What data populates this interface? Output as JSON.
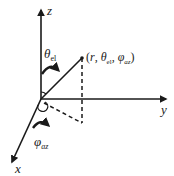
{
  "diagram": {
    "type": "spherical-coordinate-system",
    "axes": {
      "z": {
        "label": "z"
      },
      "y": {
        "label": "y"
      },
      "x": {
        "label": "x"
      }
    },
    "point": {
      "label_open": "(",
      "r": "r",
      "sep1": ", ",
      "theta_symbol": "θ",
      "theta_sub": "el",
      "sep2": ", ",
      "phi_symbol": "φ",
      "phi_sub": "az",
      "label_close": ")"
    },
    "angles": {
      "elevation": {
        "symbol": "θ",
        "subscript": "el"
      },
      "azimuth": {
        "symbol": "φ",
        "subscript": "az"
      }
    },
    "colors": {
      "stroke": "#1a1a1a",
      "background": "#ffffff"
    }
  }
}
